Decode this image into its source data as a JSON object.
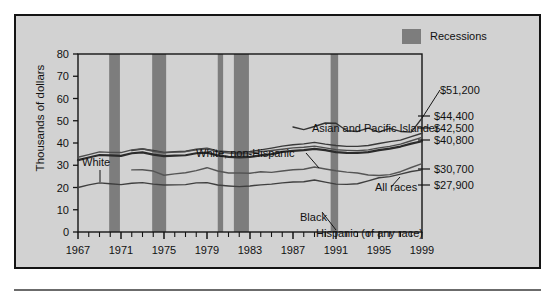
{
  "legend": {
    "items": [
      {
        "label": "Recessions",
        "color": "#7d7d7d",
        "swatch": "recession-band-swatch"
      }
    ]
  },
  "axis": {
    "y_title": "Thousands of dollars",
    "y_ticks": [
      "0",
      "10",
      "20",
      "30",
      "40",
      "50",
      "60",
      "70",
      "80"
    ],
    "x_ticks": [
      "1967",
      "1971",
      "1975",
      "1979",
      "1983",
      "1987",
      "1991",
      "1995",
      "1999"
    ]
  },
  "annotations": [
    {
      "name": "white",
      "label": "White"
    },
    {
      "name": "white-non-hispanic",
      "label": "White, non-Hispanic"
    },
    {
      "name": "asian-pacific-islander",
      "label": "Asian and Pacific Islander"
    },
    {
      "name": "all-races",
      "label": "All races"
    },
    {
      "name": "black",
      "label": "Black"
    },
    {
      "name": "hispanic",
      "label": "Hispanic (of any race)"
    }
  ],
  "end_values": [
    {
      "name": "asian-pacific-islander",
      "label": "$51,200"
    },
    {
      "name": "white-non-hispanic",
      "label": "$44,400"
    },
    {
      "name": "white",
      "label": "$42,500"
    },
    {
      "name": "all-races",
      "label": "$40,800"
    },
    {
      "name": "black",
      "label": "$30,700"
    },
    {
      "name": "hispanic",
      "label": "$27,900"
    }
  ],
  "chart_data": {
    "type": "line",
    "title": "",
    "xlabel": "",
    "ylabel": "Thousands of dollars",
    "xlim": [
      1967,
      1999
    ],
    "ylim": [
      0,
      80
    ],
    "grid": false,
    "legend_position": "top-right",
    "x": [
      1967,
      1968,
      1969,
      1970,
      1971,
      1972,
      1973,
      1974,
      1975,
      1976,
      1977,
      1978,
      1979,
      1980,
      1981,
      1982,
      1983,
      1984,
      1985,
      1986,
      1987,
      1988,
      1989,
      1990,
      1991,
      1992,
      1993,
      1994,
      1995,
      1996,
      1997,
      1998,
      1999
    ],
    "series": [
      {
        "name": "Asian and Pacific Islander",
        "color": "#333333",
        "width": 1.4,
        "x": [
          1987,
          1988,
          1989,
          1990,
          1991,
          1992,
          1993,
          1994,
          1995,
          1996,
          1997,
          1998,
          1999
        ],
        "values": [
          47.2,
          46.0,
          47.4,
          49.0,
          48.9,
          45.5,
          45.2,
          46.7,
          44.9,
          46.6,
          45.2,
          44.9,
          51.2
        ]
      },
      {
        "name": "White, non-Hispanic",
        "color": "#3a3a3a",
        "width": 1.4,
        "x": [
          1972,
          1973,
          1974,
          1975,
          1976,
          1977,
          1978,
          1979,
          1980,
          1981,
          1982,
          1983,
          1984,
          1985,
          1986,
          1987,
          1988,
          1989,
          1990,
          1991,
          1992,
          1993,
          1994,
          1995,
          1996,
          1997,
          1998,
          1999
        ],
        "values": [
          36.6,
          37.3,
          36.6,
          35.8,
          36.1,
          36.3,
          37.2,
          37.7,
          36.4,
          36.1,
          35.8,
          36.2,
          36.9,
          37.7,
          38.6,
          39.2,
          39.6,
          40.3,
          39.5,
          38.9,
          38.5,
          38.5,
          38.9,
          39.8,
          40.6,
          41.3,
          42.9,
          44.4
        ]
      },
      {
        "name": "White",
        "color": "#4d4d4d",
        "width": 1.4,
        "values": [
          33.6,
          34.8,
          36.0,
          35.8,
          35.7,
          36.9,
          37.4,
          36.3,
          35.6,
          35.9,
          36.1,
          36.9,
          37.4,
          36.0,
          35.5,
          35.2,
          35.5,
          36.1,
          36.6,
          37.2,
          37.8,
          38.1,
          38.6,
          37.8,
          37.0,
          36.7,
          36.5,
          36.9,
          37.8,
          38.5,
          39.5,
          41.0,
          42.5
        ]
      },
      {
        "name": "All races",
        "color": "#2b2b2b",
        "width": 2.2,
        "values": [
          32.3,
          33.5,
          34.6,
          34.4,
          34.2,
          35.4,
          35.8,
          34.8,
          34.1,
          34.3,
          34.5,
          35.4,
          35.7,
          34.4,
          33.8,
          33.5,
          33.8,
          34.4,
          35.0,
          36.0,
          36.5,
          36.8,
          37.4,
          36.8,
          35.9,
          35.6,
          35.5,
          35.9,
          36.8,
          37.5,
          38.4,
          39.7,
          40.8
        ]
      },
      {
        "name": "Black",
        "color": "#3f3f3f",
        "width": 1.4,
        "values": [
          20.0,
          21.2,
          22.1,
          21.7,
          21.3,
          21.9,
          22.2,
          21.5,
          21.1,
          21.2,
          21.3,
          22.1,
          22.2,
          21.1,
          20.7,
          20.4,
          20.7,
          21.2,
          21.5,
          22.1,
          22.5,
          22.6,
          23.4,
          22.4,
          21.5,
          21.4,
          21.7,
          23.0,
          24.4,
          24.9,
          26.0,
          27.2,
          27.9
        ]
      },
      {
        "name": "Hispanic (of any race)",
        "color": "#555555",
        "width": 1.4,
        "x": [
          1972,
          1973,
          1974,
          1975,
          1976,
          1977,
          1978,
          1979,
          1980,
          1981,
          1982,
          1983,
          1984,
          1985,
          1986,
          1987,
          1988,
          1989,
          1990,
          1991,
          1992,
          1993,
          1994,
          1995,
          1996,
          1997,
          1998,
          1999
        ],
        "values": [
          27.9,
          28.0,
          27.4,
          25.5,
          26.1,
          26.6,
          27.6,
          28.9,
          27.4,
          26.5,
          26.5,
          26.4,
          27.1,
          26.8,
          27.4,
          28.0,
          28.2,
          29.2,
          28.3,
          27.5,
          26.9,
          26.5,
          25.6,
          25.4,
          25.8,
          27.1,
          29.0,
          30.7
        ]
      }
    ],
    "recessions": [
      {
        "start": 1969.9,
        "end": 1970.9
      },
      {
        "start": 1973.9,
        "end": 1975.2
      },
      {
        "start": 1980.0,
        "end": 1980.5
      },
      {
        "start": 1981.5,
        "end": 1982.9
      },
      {
        "start": 1990.5,
        "end": 1991.2
      }
    ]
  }
}
